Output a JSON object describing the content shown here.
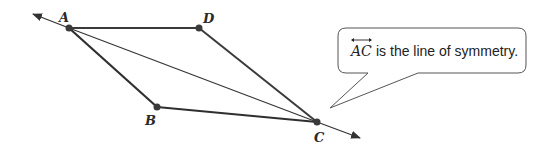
{
  "diagram": {
    "type": "geometry-figure",
    "shape": "quadrilateral",
    "points": [
      {
        "id": "A",
        "label": "A",
        "x": 69,
        "y": 28
      },
      {
        "id": "D",
        "label": "D",
        "x": 199,
        "y": 28
      },
      {
        "id": "B",
        "label": "B",
        "x": 157,
        "y": 107
      },
      {
        "id": "C",
        "label": "C",
        "x": 317,
        "y": 122
      }
    ],
    "segments": [
      "AD",
      "DC",
      "AB",
      "BC"
    ],
    "line": {
      "through": [
        "A",
        "C"
      ],
      "arrows": "both",
      "label": "AC"
    },
    "colors": {
      "stroke": "#333333",
      "point": "#3a3a3a",
      "text": "#222222"
    }
  },
  "callout": {
    "line_name": "AC",
    "text": "is the line of symmetry."
  }
}
